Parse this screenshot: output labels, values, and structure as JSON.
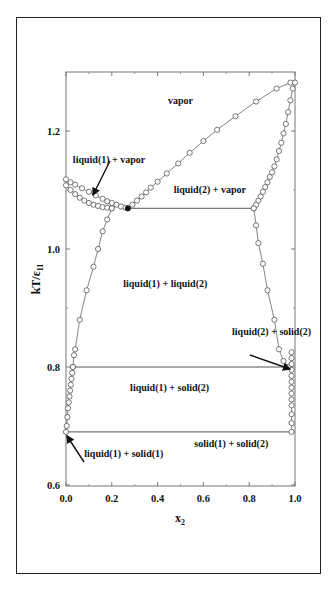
{
  "chart_data": {
    "type": "scatter",
    "title": "",
    "xlabel": "x2",
    "ylabel": "kT/ε11",
    "xlim": [
      0.0,
      1.0
    ],
    "ylim": [
      0.6,
      1.3
    ],
    "xticks": [
      "0.0",
      "0.2",
      "0.4",
      "0.6",
      "0.8",
      "1.0"
    ],
    "yticks": [
      "0.6",
      "0.8",
      "1.0",
      "1.2"
    ],
    "grid": false,
    "legend": null,
    "region_labels": [
      {
        "text": "vapor",
        "x": 0.5,
        "y": 1.245
      },
      {
        "text": "liquid(1) + vapor",
        "x": 0.03,
        "y": 1.145
      },
      {
        "text": "liquid(2) + vapor",
        "x": 0.47,
        "y": 1.095
      },
      {
        "text": "liquid(1) + liquid(2)",
        "x": 0.25,
        "y": 0.935
      },
      {
        "text": "liquid(2) + solid(2)",
        "x": 0.725,
        "y": 0.855
      },
      {
        "text": "liquid(1) + solid(2)",
        "x": 0.28,
        "y": 0.76
      },
      {
        "text": "solid(1) + solid(2)",
        "x": 0.56,
        "y": 0.665
      },
      {
        "text": "liquid(1) + solid(1)",
        "x": 0.08,
        "y": 0.648
      }
    ],
    "horizontal_lines": [
      {
        "name": "three-phase line",
        "y": 1.069,
        "x0": 0.27,
        "x1": 0.82
      },
      {
        "name": "liquid-solid(2) line",
        "y": 0.8,
        "x0": 0.02,
        "x1": 0.955
      },
      {
        "name": "eutectic line",
        "y": 0.69,
        "x0": 0.0,
        "x1": 1.0
      }
    ],
    "series": [
      {
        "name": "dew curve (vapor side)",
        "x": [
          0.27,
          0.29,
          0.31,
          0.33,
          0.35,
          0.37,
          0.4,
          0.44,
          0.49,
          0.54,
          0.6,
          0.66,
          0.74,
          0.83,
          0.92,
          0.98
        ],
        "y": [
          1.069,
          1.075,
          1.082,
          1.089,
          1.096,
          1.104,
          1.114,
          1.128,
          1.145,
          1.163,
          1.183,
          1.202,
          1.225,
          1.25,
          1.272,
          1.282
        ]
      },
      {
        "name": "liquid(1) vapor boundary",
        "x": [
          0.0,
          0.02,
          0.04,
          0.07,
          0.1,
          0.13,
          0.16,
          0.18,
          0.2,
          0.22,
          0.24,
          0.26,
          0.27
        ],
        "y": [
          1.118,
          1.113,
          1.109,
          1.103,
          1.097,
          1.091,
          1.085,
          1.081,
          1.078,
          1.075,
          1.072,
          1.07,
          1.069
        ]
      },
      {
        "name": "liquid(1) bubble curve",
        "x": [
          0.0,
          0.02,
          0.04,
          0.06,
          0.08,
          0.1,
          0.12,
          0.14,
          0.16,
          0.18,
          0.2
        ],
        "y": [
          1.108,
          1.1,
          1.093,
          1.087,
          1.082,
          1.078,
          1.075,
          1.073,
          1.071,
          1.07,
          1.069
        ]
      },
      {
        "name": "liquid(2) bubble/dew curve",
        "x": [
          0.82,
          0.83,
          0.84,
          0.85,
          0.86,
          0.87,
          0.88,
          0.89,
          0.9,
          0.91,
          0.92,
          0.93,
          0.94,
          0.95,
          0.96,
          0.97,
          0.98,
          0.99,
          1.0
        ],
        "y": [
          1.069,
          1.075,
          1.082,
          1.089,
          1.097,
          1.105,
          1.113,
          1.122,
          1.13,
          1.14,
          1.152,
          1.166,
          1.18,
          1.196,
          1.212,
          1.232,
          1.252,
          1.272,
          1.282
        ]
      },
      {
        "name": "liquid(1)-liquid(2) left coexistence",
        "x": [
          0.2,
          0.18,
          0.16,
          0.14,
          0.12,
          0.09,
          0.06,
          0.04,
          0.035,
          0.03
        ],
        "y": [
          1.069,
          1.05,
          1.03,
          1.0,
          0.97,
          0.93,
          0.88,
          0.83,
          0.82,
          0.8
        ],
        "width": 0
      },
      {
        "name": "liquid(1)-liquid(2) right coexistence",
        "x": [
          0.82,
          0.83,
          0.84,
          0.86,
          0.88,
          0.91,
          0.93,
          0.95,
          0.96,
          0.97
        ],
        "y": [
          1.069,
          1.04,
          1.01,
          0.975,
          0.93,
          0.88,
          0.83,
          0.81,
          0.8,
          0.8
        ]
      },
      {
        "name": "liquid(1) solid(2) boundary",
        "x": [
          0.03,
          0.027,
          0.024,
          0.021,
          0.018,
          0.015,
          0.012,
          0.009,
          0.006,
          0.003,
          0.0
        ],
        "y": [
          0.8,
          0.79,
          0.78,
          0.77,
          0.76,
          0.75,
          0.74,
          0.73,
          0.715,
          0.7,
          0.69
        ]
      },
      {
        "name": "solid(2) boundary near x2=1",
        "x": [
          0.985,
          0.985,
          0.985,
          0.985,
          0.985,
          0.985,
          0.985,
          0.985,
          0.985,
          0.985,
          0.985,
          0.985,
          0.985
        ],
        "y": [
          0.825,
          0.815,
          0.805,
          0.795,
          0.785,
          0.775,
          0.765,
          0.755,
          0.745,
          0.735,
          0.72,
          0.705,
          0.69
        ]
      }
    ]
  }
}
